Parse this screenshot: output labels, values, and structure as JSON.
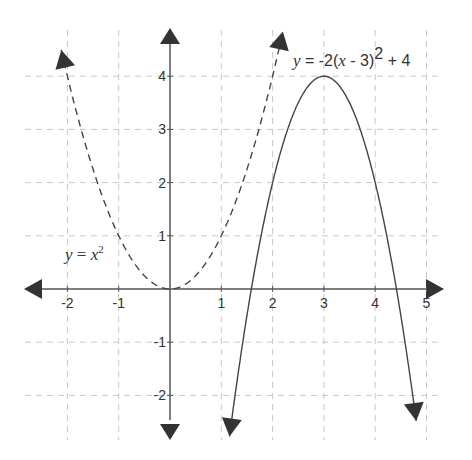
{
  "chart_data": {
    "type": "line",
    "title": "",
    "xlabel": "",
    "ylabel": "",
    "xlim": [
      -2.8,
      5.2
    ],
    "ylim": [
      -2.7,
      4.6
    ],
    "grid": true,
    "grid_style": "dashed",
    "x_ticks": [
      -2,
      -1,
      1,
      2,
      3,
      4,
      5
    ],
    "y_ticks": [
      4,
      3,
      2,
      1,
      -1,
      -2
    ],
    "x_tick_labels": [
      "-2",
      "-1",
      "1",
      "2",
      "3",
      "4",
      "5"
    ],
    "y_tick_labels": [
      "4",
      "3",
      "2",
      "1",
      "-1",
      "-2"
    ],
    "series": [
      {
        "name": "y = x^2",
        "label_parts": {
          "y": "y",
          "eq": " = ",
          "x": "x",
          "exp": "2"
        },
        "style": "dashed",
        "color": "#444444",
        "formula": "x^2",
        "x_range": [
          -2.12,
          2.2
        ],
        "arrows": "both-ends"
      },
      {
        "name": "y = -2(x - 3)^2 + 4",
        "label_parts": {
          "y": "y",
          "eq": " = -2(",
          "x": "x",
          "rest": " - 3)",
          "exp": "2",
          "tail": " + 4"
        },
        "style": "solid",
        "color": "#444444",
        "formula": "-2*(x-3)^2+4",
        "x_range": [
          1.16,
          4.8
        ],
        "vertex": [
          3,
          4
        ],
        "arrows": "both-ends"
      }
    ]
  },
  "labels": {
    "parabola1": {
      "y": "y",
      "eq": " = ",
      "x": "x",
      "exp": "2"
    },
    "parabola2": {
      "y": "y",
      "eq": " = -2(",
      "x": "x",
      "mid": " - 3)",
      "exp": "2",
      "tail": " + 4"
    }
  },
  "colors": {
    "axis": "#555555",
    "grid": "#c8c8c8",
    "curve": "#444444",
    "arrow": "#333333"
  }
}
